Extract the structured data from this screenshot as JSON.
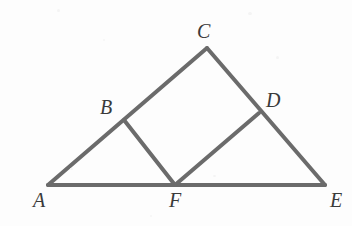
{
  "figure": {
    "background_color": "#fdfdfd",
    "stroke_color": "#6b6b6b",
    "stroke_width": 4,
    "label_color": "#3a3a3a",
    "width": 352,
    "height": 226
  },
  "points": {
    "A": {
      "label": "A",
      "x": 48,
      "y": 185,
      "label_x": 33,
      "label_y": 190
    },
    "B": {
      "label": "B",
      "x": 124,
      "y": 120,
      "label_x": 100,
      "label_y": 97
    },
    "C": {
      "label": "C",
      "x": 207,
      "y": 48,
      "label_x": 197,
      "label_y": 21
    },
    "D": {
      "label": "D",
      "x": 259,
      "y": 113,
      "label_x": 266,
      "label_y": 90
    },
    "E": {
      "label": "E",
      "x": 325,
      "y": 185,
      "label_x": 330,
      "label_y": 190
    },
    "F": {
      "label": "F",
      "x": 175,
      "y": 185,
      "label_x": 169,
      "label_y": 190
    }
  },
  "segments": [
    {
      "name": "segment-A-E",
      "from": "A",
      "to": "E",
      "description": "base line through F"
    },
    {
      "name": "segment-A-C",
      "from": "A",
      "to": "C",
      "description": "left side through B"
    },
    {
      "name": "segment-C-E",
      "from": "C",
      "to": "E",
      "description": "right side through D"
    },
    {
      "name": "segment-B-F",
      "from": "B",
      "to": "F",
      "description": "rhombus left side"
    },
    {
      "name": "segment-F-D",
      "from": "F",
      "to": "D",
      "description": "rhombus bottom-right side"
    }
  ],
  "labels_order": [
    "C",
    "B",
    "D",
    "A",
    "F",
    "E"
  ]
}
